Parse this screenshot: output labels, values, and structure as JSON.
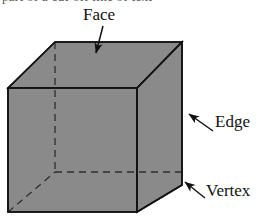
{
  "figure": {
    "partial_text_top": "part of a cut-off line of text",
    "colors": {
      "face_fill": "#8a8a8a",
      "stroke": "#121212",
      "hidden_stroke": "#2a2a2a",
      "background": "#ffffff",
      "label_text": "#111111"
    },
    "shape": {
      "name": "cube",
      "visible_faces": [
        "top",
        "front",
        "right"
      ],
      "hidden_edges": 3,
      "hidden_vertices": 1
    },
    "labels": [
      {
        "id": "face",
        "text": "Face",
        "points_to": "top face of the cube",
        "arrow": "down-arrow"
      },
      {
        "id": "edge",
        "text": "Edge",
        "points_to": "front-right vertical edge of the cube",
        "arrow": "up-left-arrow"
      },
      {
        "id": "vertex",
        "text": "Vertex",
        "points_to": "bottom-right corner of the cube",
        "arrow": "up-left-arrow"
      }
    ]
  }
}
